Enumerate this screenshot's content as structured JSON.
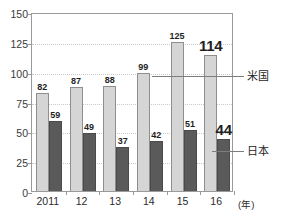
{
  "chart_data": {
    "type": "bar",
    "title": "",
    "xlabel": "(年)",
    "ylabel": "",
    "ylim": [
      0,
      150
    ],
    "yticks": [
      0,
      25,
      50,
      75,
      100,
      125,
      150
    ],
    "ytick_labels": [
      "0",
      "25",
      "50",
      "75",
      "100",
      "125",
      "150"
    ],
    "grid": true,
    "legend_position": "right-callout",
    "categories": [
      "2011",
      "12",
      "13",
      "14",
      "15",
      "16"
    ],
    "series": [
      {
        "name": "米国",
        "color": "#d5d5d5",
        "values": [
          82,
          87,
          88,
          99,
          125,
          114
        ],
        "labels": [
          "82",
          "87",
          "88",
          "99",
          "125",
          "114"
        ],
        "emphasis_index": 5
      },
      {
        "name": "日本",
        "color": "#5a5a5a",
        "values": [
          59,
          49,
          37,
          42,
          51,
          44
        ],
        "labels": [
          "59",
          "49",
          "37",
          "42",
          "51",
          "44"
        ],
        "emphasis_index": 5
      }
    ],
    "annotations": [
      {
        "name": "米国",
        "text": "米国"
      },
      {
        "name": "日本",
        "text": "日本"
      }
    ]
  },
  "axis": {
    "x_unit_label": "(年)"
  },
  "colors": {
    "series_us": "#d5d5d5",
    "series_jp": "#5a5a5a",
    "frame": "#9a9a9a",
    "gridline": "#c9c9c9",
    "text": "#1f1f1f"
  }
}
